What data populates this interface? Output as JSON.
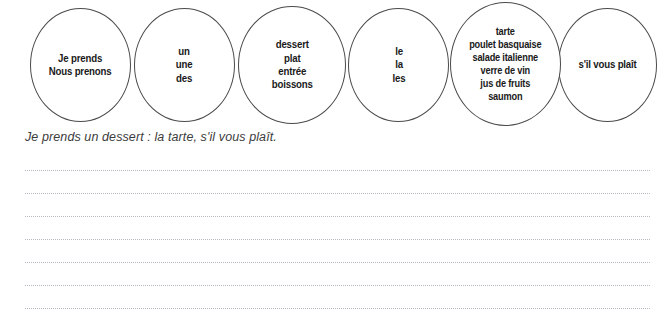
{
  "worksheet": {
    "ovals": [
      {
        "name": "subject-pronoun-verb",
        "lines": [
          "Je prends",
          "Nous prenons"
        ],
        "text": "Je prends\nNous prenons"
      },
      {
        "name": "indefinite-article",
        "lines": [
          "un",
          "une",
          "des"
        ],
        "text": "un\nune\ndes"
      },
      {
        "name": "course-category",
        "lines": [
          "dessert",
          "plat",
          "entrée",
          "boissons"
        ],
        "text": "dessert\nplat\nentrée\nboissons"
      },
      {
        "name": "definite-article",
        "lines": [
          "le",
          "la",
          "les"
        ],
        "text": "le\nla\nles"
      },
      {
        "name": "menu-item",
        "lines": [
          "tarte",
          "poulet basquaise",
          "salade italienne",
          "verre de vin",
          "jus de fruits",
          "saumon"
        ],
        "text": "tarte\npoulet basquaise\nsalade italienne\nverre de vin\njus de fruits\nsaumon"
      },
      {
        "name": "politeness-phrase",
        "lines": [
          "s'il vous plaît"
        ],
        "text": "s'il vous plaît"
      }
    ],
    "example_sentence": "Je prends un dessert : la tarte, s'il vous plaît.",
    "writing_lines": {
      "count": 7,
      "tops": [
        170,
        193,
        216,
        239,
        262,
        285,
        308
      ]
    },
    "colors": {
      "oval_stroke": "#4a4a4a",
      "oval_text": "#1a1a1a",
      "example_text": "#3c3c3c",
      "writing_line": "#b9b9c2",
      "background": "#ffffff"
    }
  }
}
